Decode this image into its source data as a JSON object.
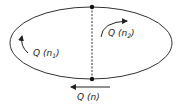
{
  "diagram": {
    "ellipse": {
      "cx": 91,
      "cy": 43,
      "rx": 81,
      "ry": 36,
      "stroke": "#333333"
    },
    "divider": {
      "x": 92,
      "y1": 7,
      "y2": 79,
      "style": "dashed"
    },
    "nodes": [
      {
        "id": "top-node",
        "x": 92,
        "y": 7
      },
      {
        "id": "bottom-node",
        "x": 92,
        "y": 79
      }
    ],
    "labels": {
      "left_region": {
        "main": "Q (n",
        "sub": "1",
        "close": ")"
      },
      "right_region": {
        "main": "Q (n",
        "sub": "2",
        "close": ")"
      },
      "bottom": {
        "text": "Q (n)"
      }
    },
    "arrows": {
      "left": "curved-up",
      "right": "curved-right",
      "bottom": "left"
    }
  }
}
